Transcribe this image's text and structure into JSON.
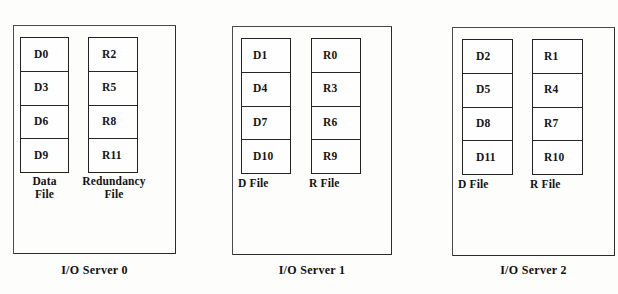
{
  "figure": {
    "background_color": "#fdfdfb",
    "ink_color": "#222222"
  },
  "servers": [
    {
      "caption": "I/O Server 0",
      "columns": [
        {
          "kind": "data",
          "label": "Data\nFile",
          "label_align": "centered",
          "blocks": [
            "D0",
            "D3",
            "D6",
            "D9"
          ]
        },
        {
          "kind": "redundancy",
          "label": "Redundancy\nFile",
          "label_align": "centered",
          "blocks": [
            "R2",
            "R5",
            "R8",
            "R11"
          ]
        }
      ]
    },
    {
      "caption": "I/O Server 1",
      "columns": [
        {
          "kind": "data",
          "label": "D File",
          "label_align": "leftal",
          "blocks": [
            "D1",
            "D4",
            "D7",
            "D10"
          ]
        },
        {
          "kind": "redundancy",
          "label": "R File",
          "label_align": "leftal",
          "blocks": [
            "R0",
            "R3",
            "R6",
            "R9"
          ]
        }
      ]
    },
    {
      "caption": "I/O Server 2",
      "columns": [
        {
          "kind": "data",
          "label": "D File",
          "label_align": "leftal",
          "blocks": [
            "D2",
            "D5",
            "D8",
            "D11"
          ]
        },
        {
          "kind": "redundancy",
          "label": "R File",
          "label_align": "leftal",
          "blocks": [
            "R1",
            "R4",
            "R7",
            "R10"
          ]
        }
      ]
    }
  ]
}
